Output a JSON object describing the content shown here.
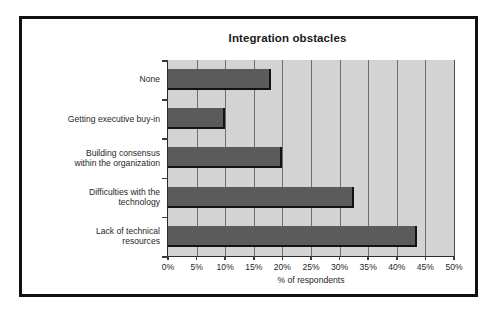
{
  "chart_data": {
    "type": "bar",
    "orientation": "horizontal",
    "title": "Integration obstacles",
    "xlabel": "% of respondents",
    "ylabel": "",
    "xlim": [
      0,
      50
    ],
    "xticks": [
      "0%",
      "5%",
      "10%",
      "15%",
      "20%",
      "25%",
      "30%",
      "35%",
      "40%",
      "45%",
      "50%"
    ],
    "xtick_values": [
      0,
      5,
      10,
      15,
      20,
      25,
      30,
      35,
      40,
      45,
      50
    ],
    "grid": "vertical",
    "legend": "none",
    "categories": [
      "None",
      "Getting executive buy-in",
      "Building consensus\nwithin the organization",
      "Difficulties with the\ntechnology",
      "Lack of technical\nresources"
    ],
    "values": [
      18,
      10,
      20,
      32.5,
      43.5
    ],
    "bars": [
      {
        "label": "None",
        "value": 18
      },
      {
        "label": "Getting executive buy-in",
        "value": 10
      },
      {
        "label": "Building consensus within the organization",
        "value": 20
      },
      {
        "label": "Difficulties with the technology",
        "value": 32.5
      },
      {
        "label": "Lack of technical resources",
        "value": 43.5
      }
    ],
    "colors": {
      "bar_fill": "#5b5b5b",
      "bar_edge": "#121212",
      "plot_background": "#d3d3d3",
      "gridline": "#6e6e6e",
      "axis": "#2b2b2b",
      "frame": "#111111",
      "text": "#1f1f1f",
      "page_background": "#ffffff"
    }
  }
}
